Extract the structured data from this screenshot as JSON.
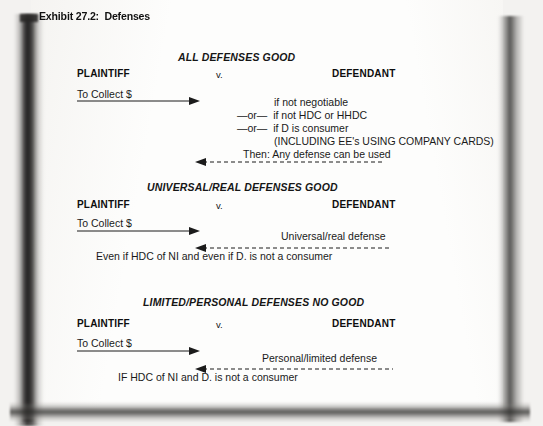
{
  "exhibit": {
    "title": "Exhibit 27.2:  Defenses"
  },
  "columns": {
    "plaintiff": "PLAINTIFF",
    "versus": "v.",
    "defendant": "DEFENDANT",
    "claim": "To Collect $"
  },
  "sections": [
    {
      "heading": "ALL DEFENSES GOOD",
      "plaintiff": "PLAINTIFF",
      "versus": "v.",
      "defendant": "DEFENDANT",
      "claim": "To Collect $",
      "defense_lines": [
        "if not negotiable",
        "—or—  if not HDC or HHDC",
        "—or—  if D is consumer",
        "(INCLUDING EE's USING COMPANY CARDS)"
      ],
      "return_label": "Then: Any defense can be used",
      "footnote": ""
    },
    {
      "heading": "UNIVERSAL/REAL DEFENSES GOOD",
      "plaintiff": "PLAINTIFF",
      "versus": "v.",
      "defendant": "DEFENDANT",
      "claim": "To Collect $",
      "defense_lines": [],
      "return_label": "Universal/real defense",
      "footnote": "Even if HDC of NI and even if D. is not a consumer"
    },
    {
      "heading": "LIMITED/PERSONAL DEFENSES NO GOOD",
      "plaintiff": "PLAINTIFF",
      "versus": "v.",
      "defendant": "DEFENDANT",
      "claim": "To Collect $",
      "defense_lines": [],
      "return_label": "Personal/limited defense",
      "footnote": "IF HDC of NI and D. is not a consumer"
    }
  ],
  "colors": {
    "ink": "#1a1a1a",
    "page": "#fdfdfc",
    "shadow": "#2d2c2b",
    "backdrop": "#f3f2f0"
  },
  "icons": {
    "forward_arrow": "arrow-right-solid",
    "return_arrow": "arrow-left-dashed"
  }
}
